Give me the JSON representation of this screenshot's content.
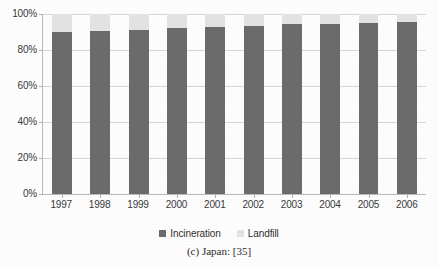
{
  "chart_data": {
    "type": "bar",
    "subtype": "stacked-percentage",
    "title": "",
    "xlabel": "",
    "ylabel": "",
    "categories": [
      "1997",
      "1998",
      "1999",
      "2000",
      "2001",
      "2002",
      "2003",
      "2004",
      "2005",
      "2006"
    ],
    "series": [
      {
        "name": "Incineration",
        "color": "#6b6b6b",
        "values": [
          90.0,
          90.7,
          91.3,
          92.0,
          92.7,
          93.5,
          94.4,
          94.5,
          95.2,
          95.5
        ]
      },
      {
        "name": "Landfill",
        "color": "#e3e3e3",
        "values": [
          10.0,
          9.3,
          8.7,
          8.0,
          7.3,
          6.5,
          5.6,
          5.5,
          4.8,
          4.5
        ]
      }
    ],
    "ylim": [
      0,
      100
    ],
    "yticks": [
      0,
      20,
      40,
      60,
      80,
      100
    ],
    "ytick_labels": [
      "0%",
      "20%",
      "40%",
      "60%",
      "80%",
      "100%"
    ],
    "grid": true,
    "legend_position": "bottom-center",
    "annotations": []
  },
  "legend": {
    "items": [
      {
        "label": "Incineration",
        "color": "#6b6b6b"
      },
      {
        "label": "Landfill",
        "color": "#e3e3e3"
      }
    ]
  },
  "caption": {
    "text": "(c) Japan: [35]"
  }
}
